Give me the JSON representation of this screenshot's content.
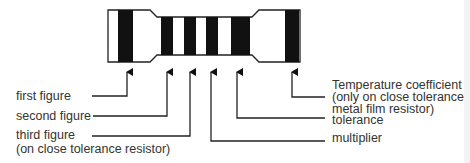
{
  "colors": {
    "ink": "#111111",
    "text": "#333333",
    "body_fill": "#ffffff"
  },
  "bands": [
    {
      "id": "first",
      "x": 118,
      "w": 15,
      "y": 10,
      "h": 52
    },
    {
      "id": "second",
      "x": 161,
      "w": 12,
      "y": 17,
      "h": 38
    },
    {
      "id": "third",
      "x": 184,
      "w": 12,
      "y": 17,
      "h": 38
    },
    {
      "id": "multiplier",
      "x": 206,
      "w": 12,
      "y": 17,
      "h": 38
    },
    {
      "id": "tolerance",
      "x": 231,
      "w": 19,
      "y": 17,
      "h": 38
    },
    {
      "id": "temperature",
      "x": 285,
      "w": 14,
      "y": 10,
      "h": 52
    }
  ],
  "labels": {
    "first_figure": "first figure",
    "second_figure": "second figure",
    "third_figure_line1": "third figure",
    "third_figure_line2": "(on close tolerance resistor)",
    "temp_line1": "Temperature coefficient",
    "temp_line2": "(only on close tolerance",
    "temp_line3": "metal film resistor)",
    "tolerance": "tolerance",
    "multiplier": "multiplier"
  }
}
